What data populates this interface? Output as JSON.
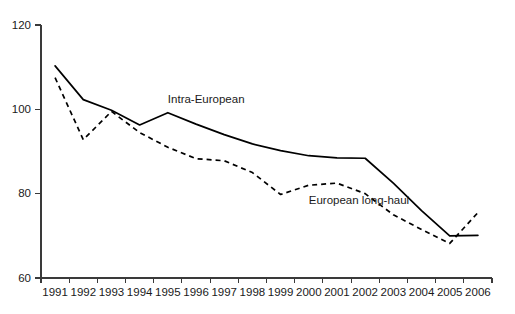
{
  "chart_data": {
    "type": "line",
    "title": "",
    "xlabel": "",
    "ylabel": "",
    "ylim": [
      60,
      120
    ],
    "yticks": [
      60,
      80,
      100,
      120
    ],
    "ytick_labels": [
      "60",
      "80",
      "100",
      "120"
    ],
    "grid": false,
    "legend_position": "inline-annotations",
    "categories": [
      "1991",
      "1992",
      "1993",
      "1994",
      "1995",
      "1996",
      "1997",
      "1998",
      "1999",
      "2000",
      "2001",
      "2002",
      "2003",
      "2004",
      "2005",
      "2006"
    ],
    "series": [
      {
        "name": "Intra-European",
        "style": "solid",
        "values": [
          110.3,
          102.3,
          99.8,
          96.3,
          99.2,
          96.5,
          94.0,
          91.8,
          90.2,
          89.0,
          88.5,
          88.4,
          82.5,
          76.0,
          70.0,
          70.1
        ]
      },
      {
        "name": "European long-haul",
        "style": "dashed",
        "values": [
          107.5,
          92.8,
          99.5,
          94.5,
          91.0,
          88.3,
          87.8,
          85.0,
          79.8,
          82.0,
          82.5,
          80.0,
          75.0,
          71.5,
          68.2,
          75.5
        ]
      }
    ],
    "annotations": [
      {
        "name": "intra-european-label",
        "text": "Intra-European",
        "x_category": "1995",
        "value": 101.5
      },
      {
        "name": "european-long-haul-label",
        "text": "European long-haul",
        "x_category": "2000",
        "value": 77.5
      }
    ]
  },
  "axes": {
    "y_tick_labels": [
      "120",
      "100",
      "80",
      "60"
    ],
    "x_tick_labels": [
      "1991",
      "1992",
      "1993",
      "1994",
      "1995",
      "1996",
      "1997",
      "1998",
      "1999",
      "2000",
      "2001",
      "2002",
      "2003",
      "2004",
      "2005",
      "2006"
    ]
  },
  "colors": {
    "background": "#ffffff",
    "axis": "#3a3a3a",
    "series_line": "#000000",
    "text": "#1a1a1a"
  }
}
